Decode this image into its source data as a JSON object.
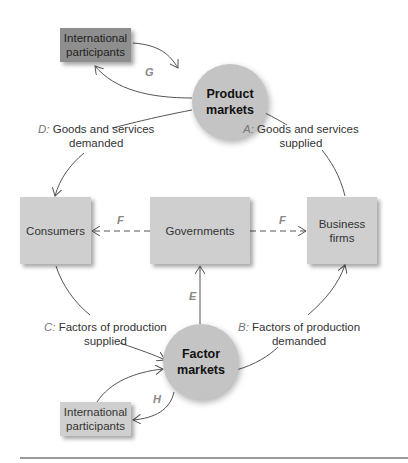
{
  "diagram": {
    "type": "circular-flow",
    "nodes": {
      "intl_top": "International participants",
      "product_markets": "Product markets",
      "consumers": "Consumers",
      "governments": "Governments",
      "business_firms": "Business firms",
      "factor_markets": "Factor markets",
      "intl_bottom": "International participants"
    },
    "flows": {
      "A": {
        "letter": "A:",
        "line1": "Goods and services",
        "line2": "supplied"
      },
      "B": {
        "letter": "B:",
        "line1": "Factors of production",
        "line2": "demanded"
      },
      "C": {
        "letter": "C:",
        "line1": "Factors of production",
        "line2": "supplied"
      },
      "D": {
        "letter": "D:",
        "line1": "Goods and services",
        "line2": "demanded"
      },
      "E": "E",
      "F_left": "F",
      "F_right": "F",
      "G": "G",
      "H": "H"
    },
    "colors": {
      "box": "#cfcfcf",
      "box_dark": "#8e8e8e",
      "circle": "#c4c4c4",
      "arrow": "#555555"
    }
  }
}
